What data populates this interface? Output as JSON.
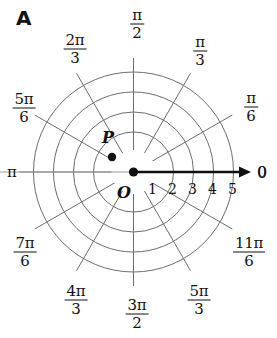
{
  "figure": {
    "panel_letter": "A",
    "type": "polar-coordinate-grid"
  },
  "chart_data": {
    "type": "scatter",
    "title": "",
    "subtitle": "",
    "coordinate_system": "polar",
    "xlabel": "",
    "ylabel": "",
    "grid": true,
    "legend": null,
    "origin_label": "O",
    "polar_axis": {
      "label": "0",
      "direction_degrees": 0,
      "arrow": true,
      "tick_values": [
        1,
        2,
        3,
        4,
        5
      ],
      "tick_labels": [
        "1",
        "2",
        "3",
        "4",
        "5"
      ]
    },
    "radial_circles": [
      1,
      2,
      3,
      4,
      5
    ],
    "radial_range": [
      0,
      5
    ],
    "angular_spokes_count": 12,
    "angular_step": "pi/6",
    "angle_labels": [
      {
        "name": "0",
        "numerator": "0",
        "denominator": null,
        "is_fraction": false,
        "angle_degrees": 0,
        "x": 262,
        "y": 172
      },
      {
        "name": "pi/6",
        "numerator": "π",
        "denominator": "6",
        "is_fraction": true,
        "angle_degrees": 30,
        "x": 251,
        "y": 107
      },
      {
        "name": "pi/3",
        "numerator": "π",
        "denominator": "3",
        "is_fraction": true,
        "angle_degrees": 60,
        "x": 200,
        "y": 51
      },
      {
        "name": "pi/2",
        "numerator": "π",
        "denominator": "2",
        "is_fraction": true,
        "angle_degrees": 90,
        "x": 137,
        "y": 24
      },
      {
        "name": "2pi/3",
        "numerator": "2π",
        "denominator": "3",
        "is_fraction": true,
        "angle_degrees": 120,
        "x": 75,
        "y": 49
      },
      {
        "name": "5pi/6",
        "numerator": "5π",
        "denominator": "6",
        "is_fraction": true,
        "angle_degrees": 150,
        "x": 24,
        "y": 108
      },
      {
        "name": "pi",
        "numerator": "π",
        "denominator": null,
        "is_fraction": false,
        "angle_degrees": 180,
        "x": 12,
        "y": 172
      },
      {
        "name": "7pi/6",
        "numerator": "7π",
        "denominator": "6",
        "is_fraction": true,
        "angle_degrees": 210,
        "x": 25,
        "y": 252
      },
      {
        "name": "4pi/3",
        "numerator": "4π",
        "denominator": "3",
        "is_fraction": true,
        "angle_degrees": 240,
        "x": 76,
        "y": 300
      },
      {
        "name": "3pi/2",
        "numerator": "3π",
        "denominator": "2",
        "is_fraction": true,
        "angle_degrees": 270,
        "x": 137,
        "y": 314
      },
      {
        "name": "5pi/3",
        "numerator": "5π",
        "denominator": "3",
        "is_fraction": true,
        "angle_degrees": 300,
        "x": 199,
        "y": 300
      },
      {
        "name": "11pi/6",
        "numerator": "11π",
        "denominator": "6",
        "is_fraction": true,
        "angle_degrees": 330,
        "x": 249,
        "y": 252
      }
    ],
    "points": [
      {
        "label": "P",
        "r": 1.2,
        "theta_degrees": 147,
        "px_x": 112,
        "px_y": 157,
        "label_px_x": 108,
        "label_px_y": 137
      }
    ],
    "annotations": [
      {
        "text": "A",
        "role": "panel-letter"
      },
      {
        "text": "O",
        "role": "origin-label"
      }
    ]
  },
  "colors": {
    "grid_line": "#6e6e6e",
    "axis": "#111111",
    "text": "#111111",
    "background": "#ffffff",
    "point_fill": "#111111"
  }
}
